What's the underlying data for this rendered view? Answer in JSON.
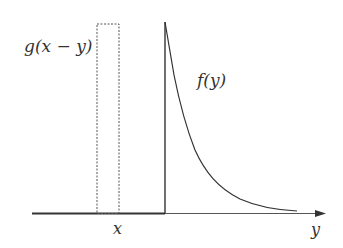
{
  "diagram": {
    "labels": {
      "g_label": "g(x − y)",
      "f_label": "f(y)",
      "x_label": "x",
      "y_axis_label": "y"
    },
    "colors": {
      "stroke": "#333333",
      "dashed": "#555555",
      "background": "#ffffff"
    },
    "elements": {
      "axis": {
        "x_start": 32,
        "x_end": 326,
        "y": 213
      },
      "window": {
        "x_left": 97,
        "x_right": 119,
        "y_top": 24,
        "y_bottom": 213,
        "style": "dashed"
      },
      "spike": {
        "x": 165,
        "y_top": 22,
        "y_bottom": 213
      },
      "decay_curve_points": [
        [
          165,
          22
        ],
        [
          174,
          75
        ],
        [
          179,
          100
        ],
        [
          186,
          125
        ],
        [
          195,
          150
        ],
        [
          208,
          172
        ],
        [
          225,
          190
        ],
        [
          250,
          203
        ],
        [
          275,
          209
        ],
        [
          297,
          211
        ]
      ]
    }
  }
}
